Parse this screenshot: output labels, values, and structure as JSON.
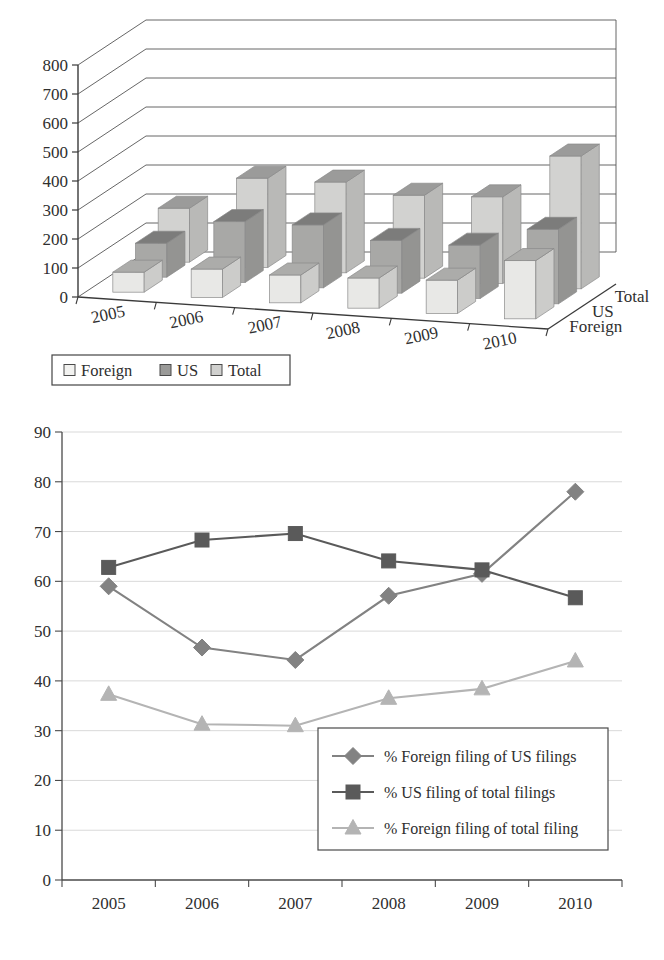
{
  "chart_data": [
    {
      "type": "bar",
      "subtype": "3d-grouped-column",
      "title": "",
      "xlabel": "",
      "ylabel": "",
      "categories": [
        "2005",
        "2006",
        "2007",
        "2008",
        "2009",
        "2010"
      ],
      "depth_categories": [
        "Foreign",
        "US",
        "Total"
      ],
      "ylim": [
        0,
        800
      ],
      "yticks": [
        0,
        100,
        200,
        300,
        400,
        500,
        600,
        700,
        800
      ],
      "grid": true,
      "legend_position": "bottom-left",
      "series": [
        {
          "name": "Foreign",
          "values": [
            69,
            98,
            96,
            104,
            115,
            201
          ],
          "color": "#e8e8e6"
        },
        {
          "name": "US",
          "values": [
            117,
            210,
            217,
            182,
            184,
            257
          ],
          "color": "#a8a8a6"
        },
        {
          "name": "Total",
          "values": [
            186,
            308,
            313,
            286,
            299,
            458
          ],
          "color": "#d2d2d0"
        }
      ],
      "legend": [
        "Foreign",
        "US",
        "Total"
      ]
    },
    {
      "type": "line",
      "title": "",
      "xlabel": "",
      "ylabel": "",
      "categories": [
        "2005",
        "2006",
        "2007",
        "2008",
        "2009",
        "2010"
      ],
      "ylim": [
        0,
        90
      ],
      "yticks": [
        0,
        10,
        20,
        30,
        40,
        50,
        60,
        70,
        80,
        90
      ],
      "grid": true,
      "legend_position": "bottom-right",
      "series": [
        {
          "name": "% Foreign filing of US filings",
          "values": [
            59,
            46.7,
            44.2,
            57.1,
            61.5,
            78
          ],
          "marker": "diamond",
          "color": "#828282"
        },
        {
          "name": "% US filing of total filings",
          "values": [
            62.8,
            68.3,
            69.6,
            64.1,
            62.3,
            56.7
          ],
          "marker": "square",
          "color": "#5a5a5a"
        },
        {
          "name": "% Foreign filing of total filing",
          "values": [
            37.3,
            31.3,
            31.0,
            36.5,
            38.4,
            44
          ],
          "marker": "triangle",
          "color": "#b4b4b4"
        }
      ]
    }
  ],
  "bar_chart": {
    "name": "3d-column-chart",
    "y_tick_labels": [
      "800",
      "700",
      "600",
      "500",
      "400",
      "300",
      "200",
      "100",
      "0"
    ],
    "x_tick_labels": [
      "2005",
      "2006",
      "2007",
      "2008",
      "2009",
      "2010"
    ],
    "depth_labels": [
      "Total",
      "US",
      "Foreign"
    ],
    "legend": [
      {
        "label": "Foreign",
        "swatch": "#f2f2f0"
      },
      {
        "label": "US",
        "swatch": "#9a9a98"
      },
      {
        "label": "Total",
        "swatch": "#d0d0ce"
      }
    ]
  },
  "line_chart": {
    "name": "line-chart",
    "y_tick_labels": [
      "90",
      "80",
      "70",
      "60",
      "50",
      "40",
      "30",
      "20",
      "10",
      "0"
    ],
    "x_tick_labels": [
      "2005",
      "2006",
      "2007",
      "2008",
      "2009",
      "2010"
    ],
    "legend": [
      {
        "label": "% Foreign filing of US filings",
        "marker": "diamond",
        "color": "#828282"
      },
      {
        "label": "% US filing of total filings",
        "marker": "square",
        "color": "#5a5a5a"
      },
      {
        "label": "% Foreign filing of total filing",
        "marker": "triangle",
        "color": "#b4b4b4"
      }
    ]
  },
  "colors": {
    "axis": "#3a3a3a",
    "grid": "#d9d9d9",
    "text": "#2f2f2f",
    "bar_foreign": "#e8e8e6",
    "bar_us": "#a8a8a6",
    "bar_total": "#d2d2d0",
    "line_foreign_us": "#828282",
    "line_us_total": "#5a5a5a",
    "line_foreign_total": "#b4b4b4"
  }
}
